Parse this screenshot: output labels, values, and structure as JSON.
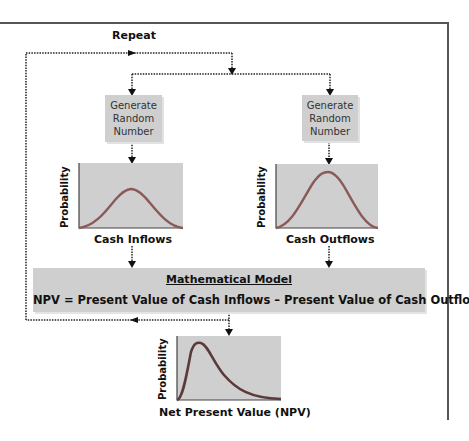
{
  "diagram": {
    "repeat_label": "Repeat",
    "generate_boxes": [
      {
        "label": "Generate Random Number",
        "lines": [
          "Generate",
          "Random",
          "Number"
        ]
      },
      {
        "label": "Generate Random Number",
        "lines": [
          "Generate",
          "Random",
          "Number"
        ]
      }
    ],
    "charts": [
      {
        "ylabel": "Probability",
        "xlabel": "Cash Inflows",
        "shape": "normal-low"
      },
      {
        "ylabel": "Probability",
        "xlabel": "Cash Outflows",
        "shape": "normal-high"
      },
      {
        "ylabel": "Probability",
        "xlabel": "Net Present Value (NPV)",
        "shape": "right-skewed"
      }
    ],
    "model": {
      "title": "Mathematical Model",
      "equation": "NPV = Present Value of Cash Inflows – Present Value of Cash Outflows"
    },
    "colors": {
      "box_fill": "#cfcfcf",
      "curve": "#8a5a5a",
      "npv_curve": "#5a3a3a",
      "frame": "#555555"
    }
  }
}
